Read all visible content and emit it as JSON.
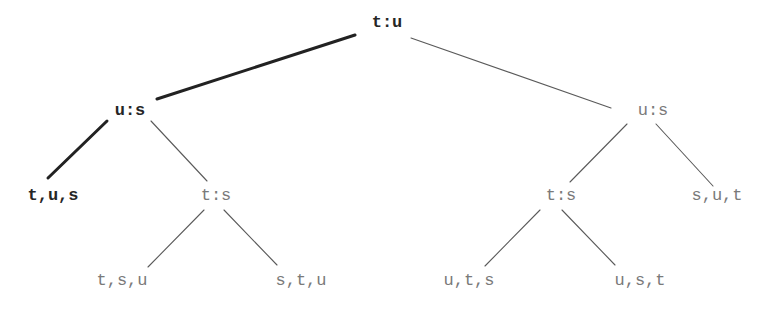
{
  "diagram": {
    "type": "decision-tree",
    "colors": {
      "highlight": "#262626",
      "normal": "#7a7a7a",
      "edge_normal": "#5a5a5a",
      "edge_highlight": "#222222",
      "background": "#ffffff"
    },
    "nodes": [
      {
        "id": "root",
        "label": "t:u",
        "x": 387,
        "y": 22,
        "highlight": true
      },
      {
        "id": "l",
        "label": "u:s",
        "x": 130,
        "y": 110,
        "highlight": true
      },
      {
        "id": "r",
        "label": "u:s",
        "x": 653,
        "y": 110,
        "highlight": false
      },
      {
        "id": "ll",
        "label": "t,u,s",
        "x": 53,
        "y": 195,
        "highlight": true
      },
      {
        "id": "lr",
        "label": "t:s",
        "x": 216,
        "y": 195,
        "highlight": false
      },
      {
        "id": "rl",
        "label": "t:s",
        "x": 561,
        "y": 195,
        "highlight": false
      },
      {
        "id": "rr",
        "label": "s,u,t",
        "x": 717,
        "y": 195,
        "highlight": false
      },
      {
        "id": "lrl",
        "label": "t,s,u",
        "x": 122,
        "y": 280,
        "highlight": false
      },
      {
        "id": "lrr",
        "label": "s,t,u",
        "x": 301,
        "y": 280,
        "highlight": false
      },
      {
        "id": "rll",
        "label": "u,t,s",
        "x": 469,
        "y": 280,
        "highlight": false
      },
      {
        "id": "rlr",
        "label": "u,s,t",
        "x": 640,
        "y": 280,
        "highlight": false
      }
    ],
    "edges": [
      {
        "from": "root",
        "to": "l",
        "x1": 355,
        "y1": 35,
        "x2": 157,
        "y2": 99,
        "highlight": true
      },
      {
        "from": "root",
        "to": "r",
        "x1": 411,
        "y1": 38,
        "x2": 611,
        "y2": 108,
        "highlight": false
      },
      {
        "from": "l",
        "to": "ll",
        "x1": 107,
        "y1": 121,
        "x2": 48,
        "y2": 178,
        "highlight": true
      },
      {
        "from": "l",
        "to": "lr",
        "x1": 151,
        "y1": 121,
        "x2": 207,
        "y2": 181,
        "highlight": false
      },
      {
        "from": "r",
        "to": "rl",
        "x1": 627,
        "y1": 124,
        "x2": 570,
        "y2": 182,
        "highlight": false
      },
      {
        "from": "r",
        "to": "rr",
        "x1": 656,
        "y1": 124,
        "x2": 713,
        "y2": 186,
        "highlight": false
      },
      {
        "from": "lr",
        "to": "lrl",
        "x1": 204,
        "y1": 210,
        "x2": 148,
        "y2": 267,
        "highlight": false
      },
      {
        "from": "lr",
        "to": "lrr",
        "x1": 224,
        "y1": 210,
        "x2": 277,
        "y2": 265,
        "highlight": false
      },
      {
        "from": "rl",
        "to": "rll",
        "x1": 540,
        "y1": 210,
        "x2": 485,
        "y2": 266,
        "highlight": false
      },
      {
        "from": "rl",
        "to": "rlr",
        "x1": 562,
        "y1": 210,
        "x2": 615,
        "y2": 265,
        "highlight": false
      }
    ]
  }
}
